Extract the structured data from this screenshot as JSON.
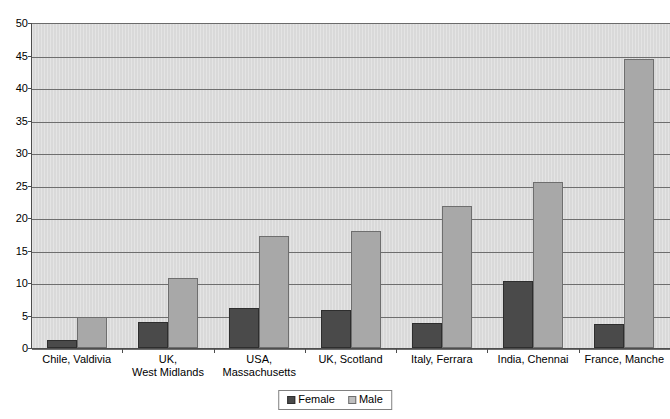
{
  "chart_data": {
    "type": "bar",
    "title": "",
    "xlabel": "",
    "ylabel": "",
    "ylim": [
      0,
      50
    ],
    "ytick_step": 5,
    "yticks": [
      0,
      5,
      10,
      15,
      20,
      25,
      30,
      35,
      40,
      45,
      50
    ],
    "grid": true,
    "legend_position": "bottom-center",
    "categories": [
      "Chile, Valdivia",
      "UK,\nWest Midlands",
      "USA,\nMassachusetts",
      "UK, Scotland",
      "Italy, Ferrara",
      "India, Chennai",
      "France, Manche"
    ],
    "category_lines": [
      [
        "Chile, Valdivia"
      ],
      [
        "UK,",
        "West Midlands"
      ],
      [
        "USA,",
        "Massachusetts"
      ],
      [
        "UK, Scotland"
      ],
      [
        "Italy, Ferrara"
      ],
      [
        "India, Chennai"
      ],
      [
        "France, Manche"
      ]
    ],
    "series": [
      {
        "name": "Female",
        "color": "#4a4a4a",
        "values": [
          1.2,
          4.0,
          6.2,
          5.9,
          3.8,
          10.3,
          3.7
        ]
      },
      {
        "name": "Male",
        "color": "#a8a8a8",
        "values": [
          4.7,
          10.7,
          17.2,
          18.0,
          21.9,
          25.5,
          44.5
        ]
      }
    ]
  },
  "legend": {
    "entries": [
      {
        "label": "Female",
        "swatch": "female-swatch"
      },
      {
        "label": "Male",
        "swatch": "male-swatch"
      }
    ]
  }
}
